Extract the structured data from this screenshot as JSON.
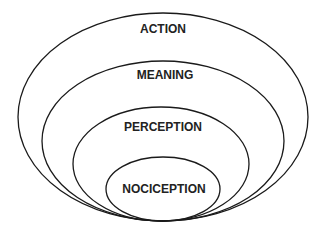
{
  "diagram": {
    "type": "nested-ellipses",
    "stroke_color": "#1a1a1a",
    "background": "#ffffff",
    "layers": [
      {
        "label": "ACTION",
        "level": 1
      },
      {
        "label": "MEANING",
        "level": 2
      },
      {
        "label": "PERCEPTION",
        "level": 3
      },
      {
        "label": "NOCICEPTION",
        "level": 4
      }
    ]
  }
}
